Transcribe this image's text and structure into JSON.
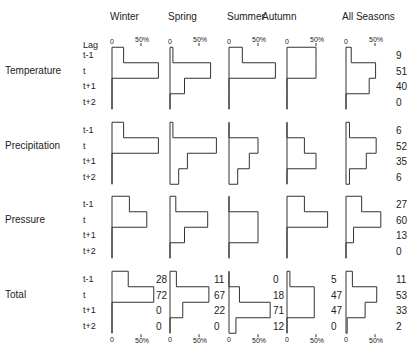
{
  "chart_data": {
    "type": "bar",
    "subtype": "horizontal-step-histogram-grid",
    "title": "",
    "seasons": [
      "Winter",
      "Spring",
      "Summer",
      "Autumn",
      "All Seasons"
    ],
    "variables": [
      "Temperature",
      "Precipitation",
      "Pressure",
      "Total"
    ],
    "lag_header": "Lag",
    "lags": [
      "t-1",
      "t",
      "t+1",
      "t+2"
    ],
    "axis_tick_zero": "0",
    "axis_tick_50": "50%",
    "xlim_percent": [
      0,
      100
    ],
    "values": {
      "Temperature": {
        "Winter": [
          20,
          80,
          0,
          0
        ],
        "Spring": [
          5,
          70,
          25,
          0
        ],
        "Summer": [
          23,
          80,
          0,
          0
        ],
        "Autumn": [
          50,
          50,
          0,
          0
        ],
        "All Seasons": [
          9,
          51,
          40,
          0
        ]
      },
      "Precipitation": {
        "Winter": [
          20,
          80,
          0,
          0
        ],
        "Spring": [
          5,
          80,
          30,
          15
        ],
        "Summer": [
          0,
          50,
          35,
          15
        ],
        "Autumn": [
          0,
          30,
          50,
          0
        ],
        "All Seasons": [
          6,
          52,
          35,
          6
        ]
      },
      "Pressure": {
        "Winter": [
          30,
          60,
          0,
          0
        ],
        "Spring": [
          10,
          65,
          25,
          0
        ],
        "Summer": [
          0,
          50,
          50,
          0
        ],
        "Autumn": [
          30,
          70,
          0,
          0
        ],
        "All Seasons": [
          27,
          60,
          13,
          0
        ]
      },
      "Total": {
        "Winter": [
          28,
          72,
          0,
          0
        ],
        "Spring": [
          11,
          67,
          22,
          0
        ],
        "Summer": [
          0,
          18,
          71,
          12
        ],
        "Autumn": [
          5,
          47,
          47,
          0
        ],
        "All Seasons": [
          11,
          53,
          33,
          2
        ]
      }
    },
    "labels": {
      "Temperature": {
        "All Seasons": [
          "9",
          "51",
          "40",
          "0"
        ]
      },
      "Precipitation": {
        "All Seasons": [
          "6",
          "52",
          "35",
          "6"
        ]
      },
      "Pressure": {
        "All Seasons": [
          "27",
          "60",
          "13",
          "0"
        ]
      },
      "Total": {
        "Winter": [
          "28",
          "72",
          "0",
          "0"
        ],
        "Spring": [
          "11",
          "67",
          "22",
          "0"
        ],
        "Summer": [
          "0",
          "18",
          "71",
          "12"
        ],
        "Autumn": [
          "5",
          "47",
          "47",
          "0"
        ],
        "All Seasons": [
          "11",
          "53",
          "33",
          "2"
        ]
      }
    },
    "xlabel": "",
    "ylabel": "Lag",
    "grid": false,
    "legend": "none"
  }
}
